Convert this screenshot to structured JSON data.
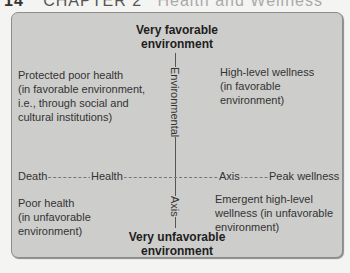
{
  "page_header": {
    "number": "14",
    "chapter": "CHAPTER 2",
    "rest": "Health and Wellness"
  },
  "diagram": {
    "title_top": {
      "line1": "Very favorable",
      "line2": "environment"
    },
    "title_bottom": {
      "line1": "Very unfavorable",
      "line2": "environment"
    },
    "vertical_axis": {
      "upper_label": "Environmental",
      "lower_label": "Axis"
    },
    "horizontal_axis": {
      "left_end": "Death",
      "label_left": "Health",
      "label_right": "Axis",
      "right_end": "Peak wellness"
    },
    "quadrants": {
      "top_left": [
        "Protected poor health",
        "(in favorable environment,",
        "i.e., through social and",
        "cultural institutions)"
      ],
      "top_right": [
        "High-level wellness",
        "(in favorable environment)"
      ],
      "bottom_left": [
        "Poor health",
        "(in unfavorable",
        "environment)"
      ],
      "bottom_right": [
        "Emergent high-level",
        "wellness (in unfavorable",
        "environment)"
      ]
    },
    "colors": {
      "box_fill": "#cdcdcb",
      "box_border": "#8d8d8b",
      "line": "#555555"
    }
  }
}
